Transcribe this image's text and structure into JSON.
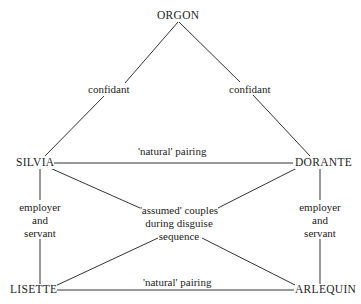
{
  "diagram": {
    "nodes": {
      "orgon": "ORGON",
      "silvia": "SILVIA",
      "dorante": "DORANTE",
      "lisette": "LISETTE",
      "arlequin": "ARLEQUIN"
    },
    "edges": {
      "orgon_silvia": "confidant",
      "orgon_dorante": "confidant",
      "silvia_dorante": "'natural' pairing",
      "lisette_arlequin": "'natural' pairing",
      "silvia_lisette": [
        "employer",
        "and",
        "servant"
      ],
      "dorante_arlequin": [
        "employer",
        "and",
        "servant"
      ],
      "assumed_couples": [
        "'assumed' couples",
        "during disguise",
        "sequence"
      ]
    }
  }
}
